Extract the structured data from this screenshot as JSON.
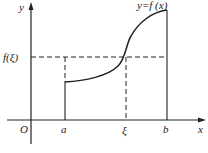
{
  "diagram": {
    "type": "mean-value-theorem-for-integrals",
    "labels": {
      "y_axis": "y",
      "x_axis": "x",
      "origin": "O",
      "a": "a",
      "xi": "ξ",
      "b": "b",
      "f_xi": "f(ξ)",
      "curve": "y=f (x)"
    },
    "colors": {
      "stroke": "#222222",
      "background": "#ffffff"
    }
  }
}
